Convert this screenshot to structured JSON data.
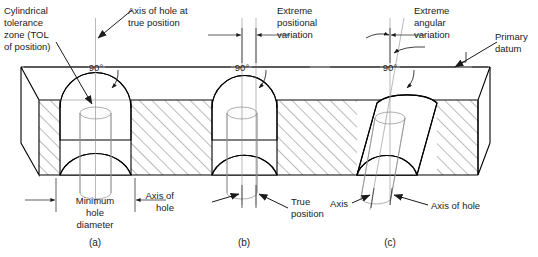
{
  "figure": {
    "type": "engineering-section-drawing"
  },
  "annotations": {
    "tolerance_zone": "Cylindrical\ntolerance\nzone (TOL\nof position)",
    "tolerance_zone_lines": [
      "Cylindrical",
      "tolerance",
      "zone (TOL",
      "of position)"
    ],
    "axis_true_position_lines": [
      "Axis of hole at",
      "true position"
    ],
    "extreme_positional_lines": [
      "Extreme",
      "positional",
      "variation"
    ],
    "extreme_angular_lines": [
      "Extreme",
      "angular",
      "variation"
    ],
    "primary_datum_lines": [
      "Primary",
      "datum"
    ],
    "minimum_hole_diameter_lines": [
      "Minimum",
      "hole",
      "diameter"
    ],
    "axis_of_hole_lines": [
      "Axis of",
      "hole"
    ],
    "true_position_lines": [
      "True",
      "position"
    ],
    "axis_label": "Axis",
    "axis_of_hole_label": "Axis of hole"
  },
  "angles": {
    "a": "90°",
    "b": "90°",
    "c": "90°"
  },
  "views": [
    {
      "id": "a",
      "caption": "(a)",
      "condition": "hole axis at true position, minimum hole diameter"
    },
    {
      "id": "b",
      "caption": "(b)",
      "condition": "extreme positional variation, axis offset from true position"
    },
    {
      "id": "c",
      "caption": "(c)",
      "condition": "extreme angular variation, axis tilted"
    }
  ],
  "colors": {
    "outline": "#000000",
    "hatch": "#1a1a1a",
    "centerline": "#8a8a8a",
    "tolerance_zone": "#8e8e8e",
    "text": "#1a1a1a",
    "background": "#ffffff"
  }
}
